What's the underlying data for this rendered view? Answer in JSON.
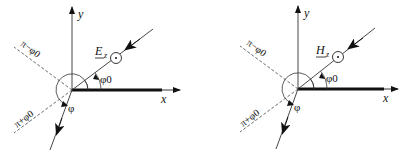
{
  "diagrams": [
    {
      "id": "left",
      "field_label": "E",
      "field_subscript": "z",
      "axis_x_label": "x",
      "axis_y_label": "y",
      "angle_incident": "φ0",
      "angle_observation": "φ",
      "dashed_upper_label": "π−φ0",
      "dashed_lower_label": "π+φ0"
    },
    {
      "id": "right",
      "field_label": "H",
      "field_subscript": "z",
      "axis_x_label": "x",
      "axis_y_label": "y",
      "angle_incident": "φ0",
      "angle_observation": "φ",
      "dashed_upper_label": "π−φ0",
      "dashed_lower_label": "π+φ0"
    }
  ],
  "colors": {
    "ink": "#111111",
    "dashed": "#444444",
    "background": "#ffffff"
  }
}
